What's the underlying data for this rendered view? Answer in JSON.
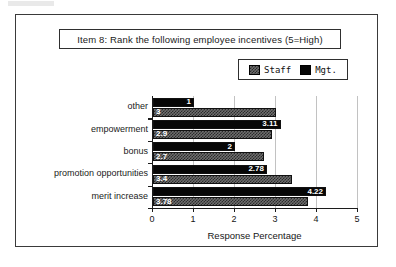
{
  "figure": {
    "title": "Item 8:  Rank the following employee incentives (5=High)"
  },
  "legend": {
    "position": "top-right",
    "entries": [
      {
        "label": "Staff",
        "pattern": "dither-checker",
        "color": "#6e6e6e"
      },
      {
        "label": "Mgt.",
        "pattern": "solid",
        "color": "#070707"
      }
    ]
  },
  "axis": {
    "x_title": "Response Percentage",
    "x_ticks": [
      "0",
      "1",
      "2",
      "3",
      "4",
      "5"
    ]
  },
  "chart_data": {
    "type": "bar",
    "orientation": "horizontal",
    "title": "Item 8:  Rank the following employee incentives (5=High)",
    "xlabel": "Response Percentage",
    "ylabel": "",
    "xlim": [
      0,
      5
    ],
    "xticks": [
      0,
      1,
      2,
      3,
      4,
      5
    ],
    "grid": true,
    "legend_position": "top-right",
    "categories": [
      "other",
      "empowerment",
      "bonus",
      "promotion  opportunities",
      "merit increase"
    ],
    "series": [
      {
        "name": "Mgt.",
        "color": "#070707",
        "values": [
          1,
          3.11,
          2,
          2.78,
          4.22
        ],
        "labels": [
          "1",
          "3.11",
          "2",
          "2.78",
          "4.22"
        ]
      },
      {
        "name": "Staff",
        "color": "#6e6e6e",
        "values": [
          3,
          2.9,
          2.7,
          3.4,
          3.78
        ],
        "labels": [
          "3",
          "2.9",
          "2.7",
          "3.4",
          "3.78"
        ]
      }
    ]
  }
}
